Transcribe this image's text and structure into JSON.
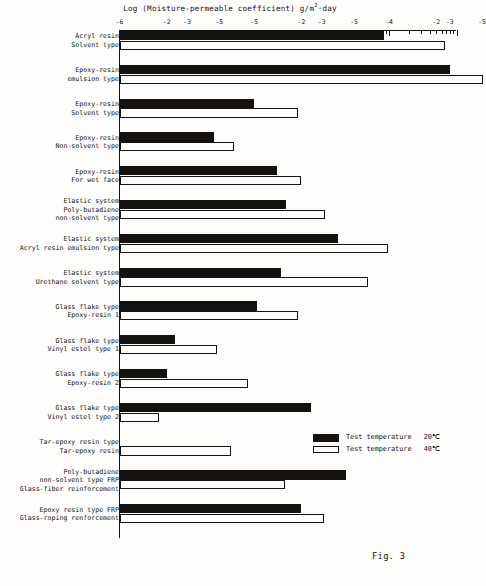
{
  "figure": {
    "caption": "Fig. 3",
    "axis_title_prefix": "Log (Moisture-permeable coefficient)",
    "axis_title_units_pre": "g/m",
    "axis_title_units_sup": "2",
    "axis_title_units_post": "·day"
  },
  "legend": {
    "position": "bottom-right",
    "entries": [
      {
        "label": "Test temperature",
        "value": "20℃",
        "style": "filled-black",
        "series": "20C"
      },
      {
        "label": "Test temperature",
        "value": "40℃",
        "style": "open-white",
        "series": "40C"
      }
    ]
  },
  "axis": {
    "orientation": "top",
    "scale": "log10",
    "min": -6,
    "max": -1,
    "major_ticks": [
      {
        "value": -6,
        "label": "-6"
      },
      {
        "value": -5,
        "label": "-5"
      },
      {
        "value": -4,
        "label": "-4"
      },
      {
        "value": -3,
        "label": "-3"
      },
      {
        "value": -2,
        "label": "-2"
      },
      {
        "value": -1,
        "label": "-1"
      }
    ],
    "printed_tick_labels": [
      "-6",
      "-2",
      "-3",
      "-5",
      "-5",
      "-2",
      "-3",
      "-5",
      "-4",
      "-2",
      "-3",
      "-5"
    ],
    "minor_per_decade": 9
  },
  "chart_data": {
    "type": "bar",
    "orientation": "horizontal",
    "xlabel": "Log (Moisture-permeable coefficient) g/m²·day",
    "ylabel": "",
    "xlim": [
      -6,
      -1
    ],
    "grid": false,
    "legend_position": "bottom-right",
    "categories": [
      "Acryl resin\nSolvent type",
      "Epoxy-resin\nemulsion type",
      "Epoxy-resin\nSolvent type",
      "Epoxy-resin\nNon-solvent type",
      "Epoxy-resin\nFor wet face",
      "Elastic system\nPoly-butadiene\nnon-solvent type",
      "Elastic system\nAcryl resin emulsion type",
      "Elastic system\nUrethane solvent type",
      "Glass flake type\nEpoxy-resin 1",
      "Glass flake type\nVinyl estel type 1",
      "Glass flake type\nEpoxy-resin 2",
      "Glass flake type\nVinyl estel type 2",
      "Tar-epoxy resin type\nTar-epoxy resin",
      "Poly-butadiene\nnon-solvent type FRP\nGlass-fiber reinforcement",
      "Epoxy resin type FRP\nGlass-roping renforcement"
    ],
    "series": [
      {
        "name": "Test temperature 20℃",
        "color": "#14110f",
        "values": [
          -2.07,
          -1.1,
          -4.0,
          -4.6,
          -3.66,
          -3.53,
          -2.76,
          -3.6,
          -3.96,
          -5.18,
          -5.3,
          -3.16,
          null,
          -2.64,
          -3.3
        ]
      },
      {
        "name": "Test temperature 40℃",
        "color": "#ffffff",
        "values": [
          -1.17,
          -0.6,
          -3.35,
          -4.3,
          -3.3,
          -2.95,
          -2.02,
          -2.31,
          -3.35,
          -4.55,
          -4.1,
          -5.42,
          -4.35,
          -3.55,
          -2.96
        ]
      }
    ],
    "notes": [
      "Epoxy-resin emulsion type bars extend past the right edge of the plot frame.",
      "Tar-epoxy resin type has no 20℃ (black) bar drawn.",
      "Glass flake type Vinyl estel type 2 has a very short 40℃ (white) bar."
    ]
  }
}
